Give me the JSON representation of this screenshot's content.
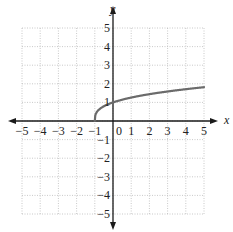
{
  "chart_data": {
    "type": "line",
    "title": "",
    "xlabel": "x",
    "ylabel": "y",
    "xlim": [
      -5,
      5
    ],
    "ylim": [
      -5,
      5
    ],
    "grid": true,
    "x_ticks": [
      -5,
      -4,
      -3,
      -2,
      -1,
      0,
      1,
      2,
      3,
      4,
      5
    ],
    "y_ticks": [
      -5,
      -4,
      -3,
      -2,
      -1,
      1,
      2,
      3,
      4,
      5
    ],
    "x_tick_labels": [
      "−5",
      "−4",
      "−3",
      "−2",
      "−1",
      "0",
      "1",
      "2",
      "3",
      "4",
      "5"
    ],
    "y_tick_labels": [
      "−5",
      "−4",
      "−3",
      "−2",
      "−1",
      "1",
      "2",
      "3",
      "4",
      "5"
    ],
    "series": [
      {
        "name": "f(x) = cube root of (x + 1)",
        "x": [
          -1,
          -0.875,
          -0.5,
          0,
          1,
          2,
          3,
          4,
          5
        ],
        "y": [
          0,
          0.5,
          0.79,
          1,
          1.26,
          1.44,
          1.59,
          1.71,
          1.82
        ],
        "color": "#6b6b6b"
      }
    ],
    "colors": {
      "axis": "#1a1a1a",
      "grid": "#bbbbbb",
      "curve": "#6b6b6b"
    }
  }
}
